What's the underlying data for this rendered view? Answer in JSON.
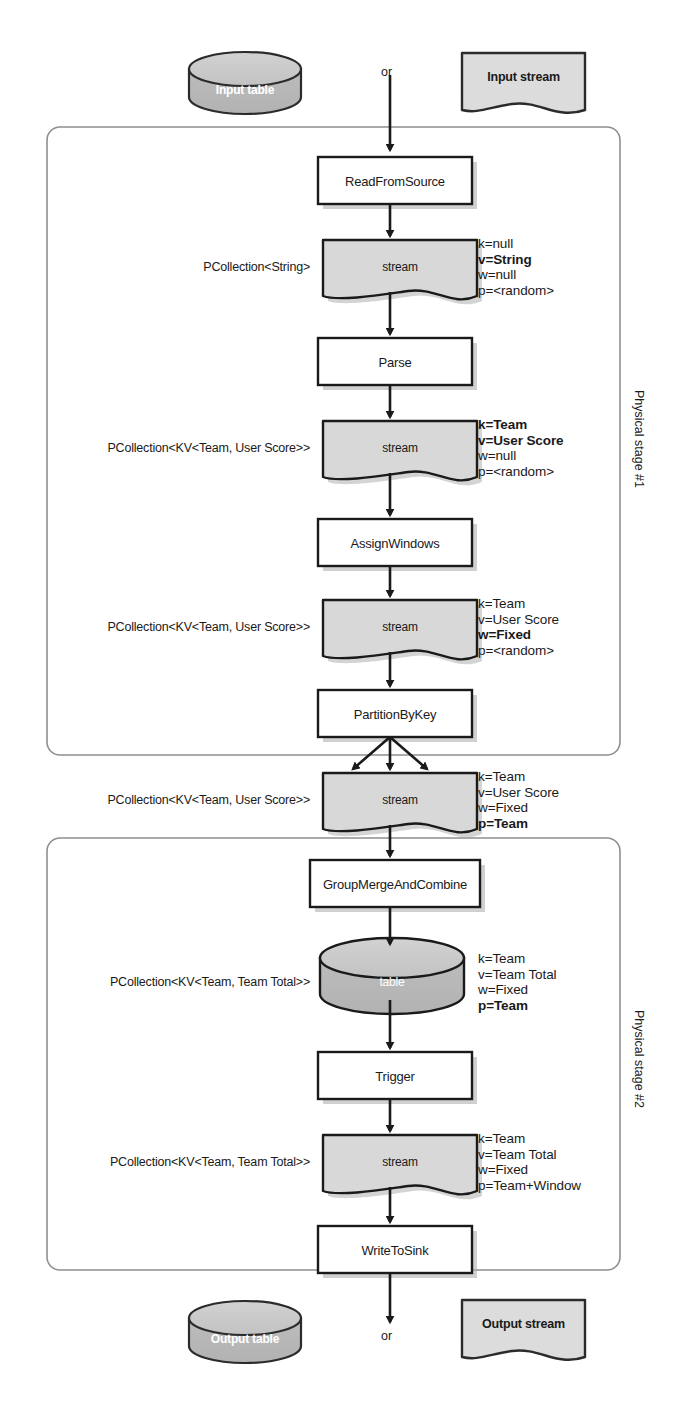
{
  "diagram": {
    "colors": {
      "shape_fill": "#d8d8d8",
      "cyl_top_fill": "#c9c9c9",
      "cyl_body_fill": "#b9b9b9",
      "box_fill": "#ffffff",
      "stroke": "#1a1a1a",
      "stage_stroke": "#8a8a8a",
      "text": "#1a1a1a",
      "caption_white": "#ffffff",
      "shadow": "#9a9a9a"
    },
    "or_labels": {
      "top": "or",
      "bottom": "or"
    },
    "sources": {
      "table": "Input table",
      "stream": "Input stream"
    },
    "sinks": {
      "table": "Output table",
      "stream": "Output stream"
    },
    "stages": [
      {
        "label": "Physical stage #1"
      },
      {
        "label": "Physical stage #2"
      }
    ],
    "transforms": [
      {
        "name": "ReadFromSource"
      },
      {
        "name": "Parse"
      },
      {
        "name": "AssignWindows"
      },
      {
        "name": "PartitionByKey"
      },
      {
        "name": "GroupMergeAndCombine"
      },
      {
        "name": "Trigger"
      },
      {
        "name": "WriteToSink"
      }
    ],
    "pcollections": [
      {
        "type_label": "PCollection<String>",
        "shape": "stream",
        "shape_caption": "stream",
        "attributes": [
          {
            "text": "k=null",
            "bold": false
          },
          {
            "text": "v=String",
            "bold": true
          },
          {
            "text": "w=null",
            "bold": false
          },
          {
            "text": "p=<random>",
            "bold": false
          }
        ]
      },
      {
        "type_label": "PCollection<KV<Team, User Score>>",
        "shape": "stream",
        "shape_caption": "stream",
        "attributes": [
          {
            "text": "k=Team",
            "bold": true
          },
          {
            "text": "v=User Score",
            "bold": true
          },
          {
            "text": "w=null",
            "bold": false
          },
          {
            "text": "p=<random>",
            "bold": false
          }
        ]
      },
      {
        "type_label": "PCollection<KV<Team, User Score>>",
        "shape": "stream",
        "shape_caption": "stream",
        "attributes": [
          {
            "text": "k=Team",
            "bold": false
          },
          {
            "text": "v=User Score",
            "bold": false
          },
          {
            "text": "w=Fixed",
            "bold": true
          },
          {
            "text": "p=<random>",
            "bold": false
          }
        ]
      },
      {
        "type_label": "PCollection<KV<Team, User Score>>",
        "shape": "stream",
        "shape_caption": "stream",
        "attributes": [
          {
            "text": "k=Team",
            "bold": false
          },
          {
            "text": "v=User Score",
            "bold": false
          },
          {
            "text": "w=Fixed",
            "bold": false
          },
          {
            "text": "p=Team",
            "bold": true
          }
        ]
      },
      {
        "type_label": "PCollection<KV<Team, Team Total>>",
        "shape": "table",
        "shape_caption": "table",
        "attributes": [
          {
            "text": "k=Team",
            "bold": false
          },
          {
            "text": "v=Team Total",
            "bold": false
          },
          {
            "text": "w=Fixed",
            "bold": false
          },
          {
            "text": "p=Team",
            "bold": true
          }
        ]
      },
      {
        "type_label": "PCollection<KV<Team, Team Total>>",
        "shape": "stream",
        "shape_caption": "stream",
        "attributes": [
          {
            "text": "k=Team",
            "bold": false
          },
          {
            "text": "v=Team Total",
            "bold": false
          },
          {
            "text": "w=Fixed",
            "bold": false
          },
          {
            "text": "p=Team+Window",
            "bold": false
          }
        ]
      }
    ]
  }
}
